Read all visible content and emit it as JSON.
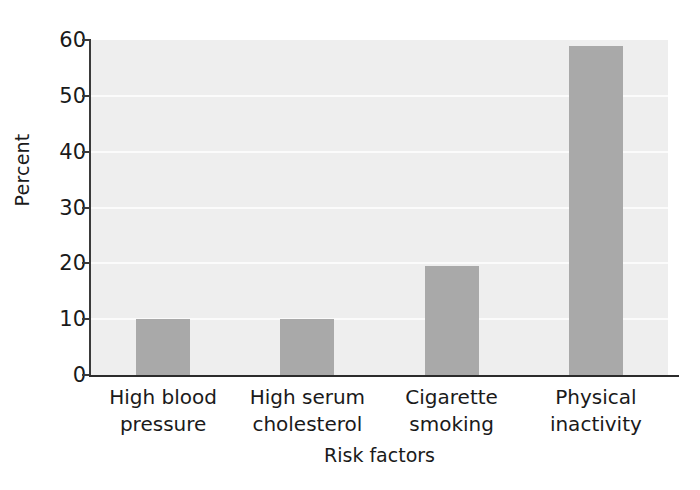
{
  "chart_data": {
    "type": "bar",
    "title": "",
    "subtitle": "",
    "categories": [
      "High blood pressure",
      "High serum cholesterol",
      "Cigarette smoking",
      "Physical inactivity"
    ],
    "category_lines": [
      [
        "High blood",
        "pressure"
      ],
      [
        "High serum",
        "cholesterol"
      ],
      [
        "Cigarette",
        "smoking"
      ],
      [
        "Physical",
        "inactivity"
      ]
    ],
    "values": [
      10,
      10,
      19.5,
      59
    ],
    "xlabel": "Risk factors",
    "ylabel": "Percent",
    "ylim": [
      0,
      60
    ],
    "ytick_values": [
      0,
      10,
      20,
      30,
      40,
      50,
      60
    ],
    "ytick_labels": [
      "0",
      "10",
      "20",
      "30",
      "40",
      "50",
      "60"
    ],
    "grid": true,
    "grid_axis": "y",
    "legend": false,
    "legend_position": "none",
    "bar_color": "#a9a9a9",
    "plot_background": "#eeeeee",
    "gridline_color": "#fbfbfb",
    "axis_color": "#2b2b2b",
    "figure_background": "#ffffff",
    "annotations": []
  }
}
